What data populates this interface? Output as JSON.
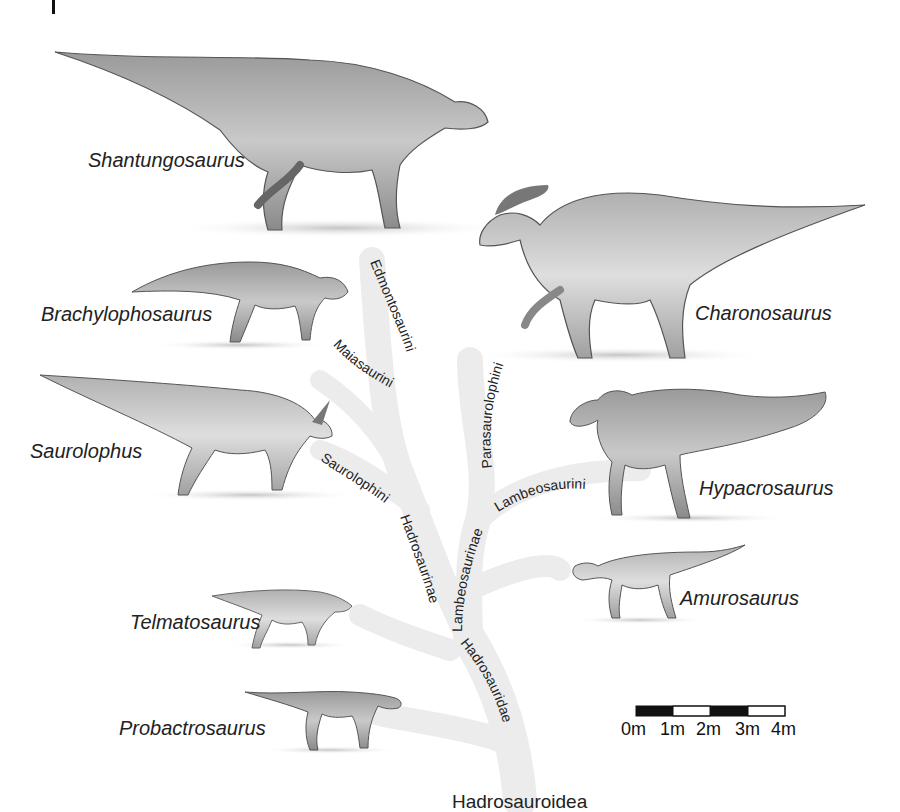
{
  "root_label": "Hadrosauroidea",
  "colors": {
    "background": "#ffffff",
    "branch": "#ebebeb",
    "text": "#222222",
    "scale_dark": "#111111",
    "scale_light": "#ffffff"
  },
  "taxa": [
    {
      "id": "shantungosaurus",
      "label": "Shantungosaurus",
      "side": "left"
    },
    {
      "id": "brachylophosaurus",
      "label": "Brachylophosaurus",
      "side": "left"
    },
    {
      "id": "saurolophus",
      "label": "Saurolophus",
      "side": "left"
    },
    {
      "id": "telmatosaurus",
      "label": "Telmatosaurus",
      "side": "left"
    },
    {
      "id": "probactrosaurus",
      "label": "Probactrosaurus",
      "side": "left"
    },
    {
      "id": "charonosaurus",
      "label": "Charonosaurus",
      "side": "right"
    },
    {
      "id": "hypacrosaurus",
      "label": "Hypacrosaurus",
      "side": "right"
    },
    {
      "id": "amurosaurus",
      "label": "Amurosaurus",
      "side": "right"
    }
  ],
  "clades": {
    "edmontosaurini": "Edmontosaurini",
    "maiasaurini": "Maiasaurini",
    "saurolophini": "Saurolophini",
    "hadrosaurinae": "Hadrosaurinae",
    "parasaurolophini": "Parasaurolophini",
    "lambeosaurini": "Lambeosaurini",
    "lambeosaurinae": "Lambeosaurinae",
    "hadrosauridae": "Hadrosauridae"
  },
  "scale_bar": {
    "unit": "m",
    "ticks": [
      "0m",
      "1m",
      "2m",
      "3m",
      "4m"
    ],
    "segments": [
      "dark",
      "light",
      "dark",
      "light"
    ]
  }
}
